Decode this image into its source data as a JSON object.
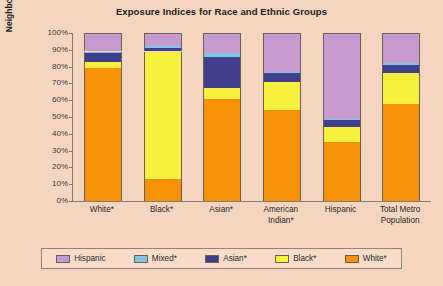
{
  "chart_data": {
    "type": "bar",
    "title": "Exposure Indices for Race and Ethnic Groups",
    "xlabel": "",
    "ylabel": "Neighborhood Composition",
    "ylim": [
      0,
      100
    ],
    "stacked": true,
    "grid": false,
    "legend_position": "bottom",
    "categories": [
      "White*",
      "Black*",
      "Asian*",
      "American Indian*",
      "Hispanic",
      "Total Metro Population"
    ],
    "category_lines": [
      [
        "White*"
      ],
      [
        "Black*"
      ],
      [
        "Asian*"
      ],
      [
        "American",
        "Indian*"
      ],
      [
        "Hispanic"
      ],
      [
        "Total Metro",
        "Population"
      ]
    ],
    "y_ticks": [
      "100%",
      "90%",
      "80%",
      "70%",
      "60%",
      "50%",
      "40%",
      "30%",
      "20%",
      "10%",
      "0%"
    ],
    "series": [
      {
        "name": "White*",
        "color": "#F5920A",
        "values": [
          79,
          13,
          61,
          54,
          35,
          58
        ]
      },
      {
        "name": "Black*",
        "color": "#F7F03C",
        "values": [
          4,
          76,
          6,
          17,
          9,
          18
        ]
      },
      {
        "name": "Asian*",
        "color": "#403F8C",
        "values": [
          5,
          2,
          19,
          5,
          4,
          5
        ]
      },
      {
        "name": "Mixed*",
        "color": "#7FC5DF",
        "values": [
          1,
          1,
          2,
          1,
          1,
          1
        ]
      },
      {
        "name": "Hispanic",
        "color": "#C49ACF",
        "values": [
          11,
          8,
          12,
          23,
          51,
          18
        ]
      }
    ],
    "legend_order": [
      "Hispanic",
      "Mixed*",
      "Asian*",
      "Black*",
      "White*"
    ],
    "legend_colors": {
      "Hispanic": "#C49ACF",
      "Mixed*": "#7FC5DF",
      "Asian*": "#403F8C",
      "Black*": "#F7F03C",
      "White*": "#F5920A"
    },
    "palette": {
      "page_background": "#F4D5C0",
      "legend_background": "#F6DCC9",
      "axis": "#8a7a6d",
      "text": "#2b2b2b"
    }
  }
}
